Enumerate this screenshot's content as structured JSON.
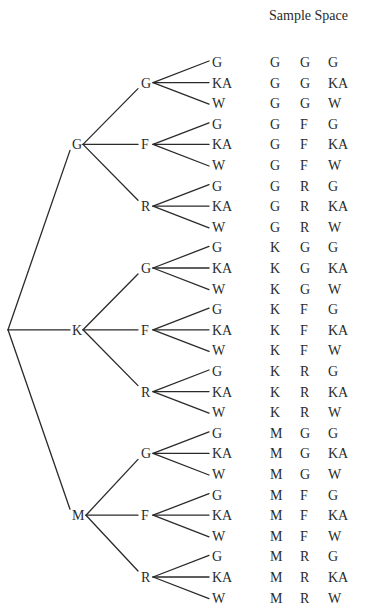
{
  "title": "Sample Space",
  "root": {
    "children": [
      {
        "label": "G",
        "children": [
          {
            "label": "G",
            "children": [
              {
                "label": "G"
              },
              {
                "label": "KA"
              },
              {
                "label": "W"
              }
            ]
          },
          {
            "label": "F",
            "children": [
              {
                "label": "G"
              },
              {
                "label": "KA"
              },
              {
                "label": "W"
              }
            ]
          },
          {
            "label": "R",
            "children": [
              {
                "label": "G"
              },
              {
                "label": "KA"
              },
              {
                "label": "W"
              }
            ]
          }
        ]
      },
      {
        "label": "K",
        "children": [
          {
            "label": "G",
            "children": [
              {
                "label": "G"
              },
              {
                "label": "KA"
              },
              {
                "label": "W"
              }
            ]
          },
          {
            "label": "F",
            "children": [
              {
                "label": "G"
              },
              {
                "label": "KA"
              },
              {
                "label": "W"
              }
            ]
          },
          {
            "label": "R",
            "children": [
              {
                "label": "G"
              },
              {
                "label": "KA"
              },
              {
                "label": "W"
              }
            ]
          }
        ]
      },
      {
        "label": "M",
        "children": [
          {
            "label": "G",
            "children": [
              {
                "label": "G"
              },
              {
                "label": "KA"
              },
              {
                "label": "W"
              }
            ]
          },
          {
            "label": "F",
            "children": [
              {
                "label": "G"
              },
              {
                "label": "KA"
              },
              {
                "label": "W"
              }
            ]
          },
          {
            "label": "R",
            "children": [
              {
                "label": "G"
              },
              {
                "label": "KA"
              },
              {
                "label": "W"
              }
            ]
          }
        ]
      }
    ]
  },
  "sample_space": [
    [
      "G",
      "G",
      "G"
    ],
    [
      "G",
      "G",
      "KA"
    ],
    [
      "G",
      "G",
      "W"
    ],
    [
      "G",
      "F",
      "G"
    ],
    [
      "G",
      "F",
      "KA"
    ],
    [
      "G",
      "F",
      "W"
    ],
    [
      "G",
      "R",
      "G"
    ],
    [
      "G",
      "R",
      "KA"
    ],
    [
      "G",
      "R",
      "W"
    ],
    [
      "K",
      "G",
      "G"
    ],
    [
      "K",
      "G",
      "KA"
    ],
    [
      "K",
      "G",
      "W"
    ],
    [
      "K",
      "F",
      "G"
    ],
    [
      "K",
      "F",
      "KA"
    ],
    [
      "K",
      "F",
      "W"
    ],
    [
      "K",
      "R",
      "G"
    ],
    [
      "K",
      "R",
      "KA"
    ],
    [
      "K",
      "R",
      "W"
    ],
    [
      "M",
      "G",
      "G"
    ],
    [
      "M",
      "G",
      "KA"
    ],
    [
      "M",
      "G",
      "W"
    ],
    [
      "M",
      "F",
      "G"
    ],
    [
      "M",
      "F",
      "KA"
    ],
    [
      "M",
      "F",
      "W"
    ],
    [
      "M",
      "R",
      "G"
    ],
    [
      "M",
      "R",
      "KA"
    ],
    [
      "M",
      "R",
      "W"
    ]
  ]
}
